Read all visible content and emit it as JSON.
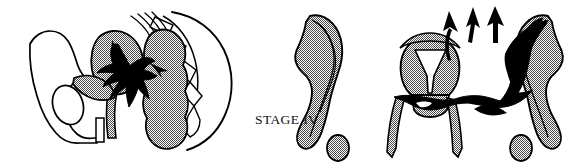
{
  "figure": {
    "caption": "STAGE IV",
    "width": 577,
    "height": 165,
    "background_color": "#ffffff",
    "outline_color": "#000000",
    "tumor_color": "#000000",
    "organ_fill_color": "#b8b8b8",
    "panels": [
      {
        "name": "sagittal-pelvis-view",
        "description": "Midsagittal section of the female pelvis showing bladder, uterus, rectum, sacrum and a black tumor mass invading adjacent organs",
        "parts": [
          "pelvic-bone-outline",
          "obturator-foramen",
          "pubic-symphysis",
          "bladder",
          "uterus",
          "rectum",
          "sacrum-vertebrae",
          "coccyx",
          "tumor-mass"
        ]
      },
      {
        "name": "coronal-pelvis-view",
        "description": "Coronal view showing left pelvic sidewall, uterus with cervical canal, vagina, right pelvic sidewall infiltrated by black tumor, with three arrows indicating extension of disease",
        "parts": [
          "left-pelvic-sidewall",
          "uterus-body",
          "endometrial-cavity",
          "cervix",
          "vagina",
          "right-pelvic-sidewall",
          "tumor-mass",
          "spread-arrows"
        ]
      }
    ],
    "arrows": {
      "name": "spread-arrows",
      "count": 3,
      "direction": "up",
      "meaning": "tumor extension beyond true pelvis"
    }
  }
}
